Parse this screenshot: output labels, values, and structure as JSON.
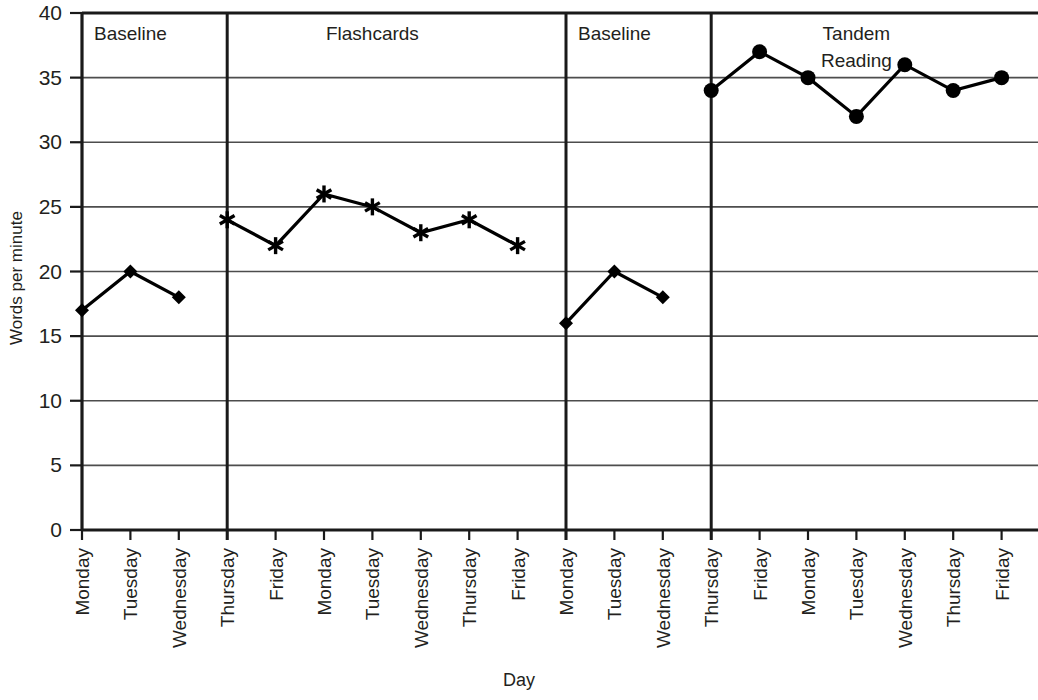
{
  "chart_data": {
    "type": "line",
    "title": "",
    "xlabel": "Day",
    "ylabel": "Words per minute",
    "ylim": [
      0,
      40
    ],
    "ytick_labels": [
      "0",
      "5",
      "10",
      "15",
      "20",
      "25",
      "30",
      "35",
      "40"
    ],
    "ytick_values": [
      0,
      5,
      10,
      15,
      20,
      25,
      30,
      35,
      40
    ],
    "grid": "horizontal",
    "legend_position": "none",
    "categories": [
      "Monday",
      "Tuesday",
      "Wednesday",
      "Thursday",
      "Friday",
      "Monday",
      "Tuesday",
      "Wednesday",
      "Thursday",
      "Friday",
      "Monday",
      "Tuesday",
      "Wednesday",
      "Thursday",
      "Friday",
      "Monday",
      "Tuesday",
      "Wednesday",
      "Thursday",
      "Friday"
    ],
    "phases": [
      {
        "label": "Baseline",
        "start_index": 0,
        "end_index": 2,
        "marker": "diamond"
      },
      {
        "label": "Flashcards",
        "start_index": 3,
        "end_index": 9,
        "marker": "star"
      },
      {
        "label": "Baseline",
        "start_index": 10,
        "end_index": 12,
        "marker": "diamond"
      },
      {
        "label": "Tandem Reading",
        "start_index": 13,
        "end_index": 19,
        "marker": "circle"
      }
    ],
    "series": [
      {
        "name": "Baseline 1",
        "marker": "diamond",
        "x": [
          0,
          1,
          2
        ],
        "values": [
          17,
          20,
          18
        ]
      },
      {
        "name": "Flashcards",
        "marker": "star",
        "x": [
          3,
          4,
          5,
          6,
          7,
          8,
          9
        ],
        "values": [
          24,
          22,
          26,
          25,
          23,
          24,
          22
        ]
      },
      {
        "name": "Baseline 2",
        "marker": "diamond",
        "x": [
          10,
          11,
          12
        ],
        "values": [
          16,
          20,
          18
        ]
      },
      {
        "name": "Tandem Reading",
        "marker": "circle",
        "x": [
          13,
          14,
          15,
          16,
          17,
          18,
          19
        ],
        "values": [
          34,
          37,
          35,
          32,
          36,
          34,
          35
        ]
      }
    ],
    "phase_divider_indices": [
      3,
      10,
      13
    ],
    "colors": {
      "line": "#000000",
      "grid": "#4d4d4d",
      "axis": "#1a1a1a",
      "text": "#231f20",
      "background": "#ffffff"
    }
  }
}
